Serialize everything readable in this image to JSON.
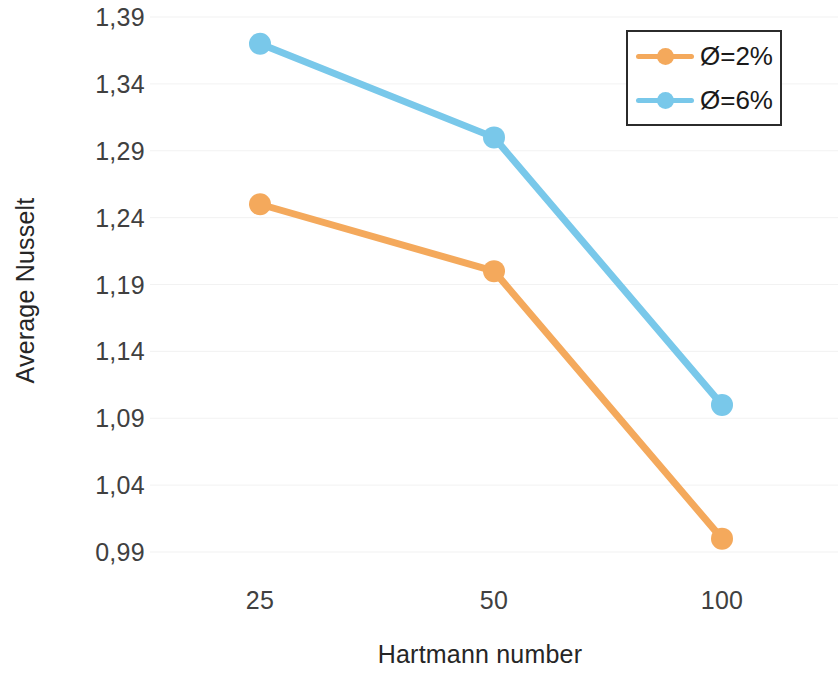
{
  "chart_data": {
    "type": "line",
    "title": "",
    "xlabel": "Hartmann number",
    "ylabel": "Average Nusselt",
    "categories": [
      "25",
      "50",
      "100"
    ],
    "x_values": [
      25,
      50,
      100
    ],
    "ylim": [
      0.99,
      1.39
    ],
    "y_ticks": [
      0.99,
      1.04,
      1.09,
      1.14,
      1.19,
      1.24,
      1.29,
      1.34,
      1.39
    ],
    "y_tick_labels": [
      "0,99",
      "1,04",
      "1,09",
      "1,14",
      "1,19",
      "1,24",
      "1,29",
      "1,34",
      "1,39"
    ],
    "x_tick_labels": [
      "25",
      "50",
      "100"
    ],
    "grid": true,
    "grid_axis": "y",
    "legend_position": "top-right",
    "decimal_separator": ",",
    "series": [
      {
        "name": "Ø=2%",
        "color": "#F4A95C",
        "marker": "circle",
        "values": [
          1.25,
          1.2,
          1.0
        ]
      },
      {
        "name": "Ø=6%",
        "color": "#79C8EA",
        "marker": "circle",
        "values": [
          1.37,
          1.3,
          1.1
        ]
      }
    ]
  },
  "legend": {
    "items": [
      {
        "label": "Ø=2%",
        "color": "#F4A95C"
      },
      {
        "label": "Ø=6%",
        "color": "#79C8EA"
      }
    ]
  },
  "axes": {
    "y_title": "Average Nusselt",
    "x_title": "Hartmann number"
  },
  "colors": {
    "series_orange": "#F4A95C",
    "series_blue": "#79C8EA",
    "gridline": "#E9E9E9",
    "text": "#262626",
    "legend_border": "#2B2B2B",
    "background": "#FFFFFF"
  }
}
